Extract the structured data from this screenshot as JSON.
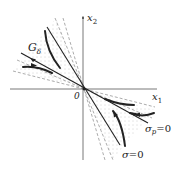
{
  "figure": {
    "type": "phase-plane diagram",
    "axes": {
      "x_label": "x",
      "x_sub": "1",
      "y_label": "x",
      "y_sub": "2",
      "origin_label": "0"
    },
    "region_label": {
      "main": "G",
      "sub": "δ"
    },
    "lines": [
      {
        "label_main": "σ",
        "label_sub": "p",
        "label_rest": "=0"
      },
      {
        "label_main": "σ",
        "label_rest": "=0"
      }
    ],
    "colors": {
      "ink": "#222222",
      "axis": "#555555",
      "dashed": "#888888",
      "dots": "#999999",
      "background": "#ffffff"
    }
  }
}
